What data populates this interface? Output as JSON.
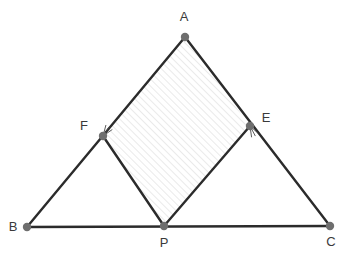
{
  "figure": {
    "canvas": {
      "width": 350,
      "height": 263,
      "background": "#ffffff"
    },
    "style": {
      "line_color": "#2b2b2b",
      "line_width": 2.4,
      "point_color": "#6e6e6e",
      "point_radius": 4.2,
      "label_color": "#3a3a3a",
      "label_font_size": 13,
      "hatch_color": "#d9d9d9",
      "hatch_angle_deg": 45,
      "hatch_spacing": 5,
      "tick_color": "#4a4a4a"
    },
    "points": [
      {
        "id": "A",
        "label": "A",
        "x": 185,
        "y": 37,
        "label_x": 184,
        "label_y": 18
      },
      {
        "id": "B",
        "label": "B",
        "x": 27,
        "y": 227,
        "label_x": 13,
        "label_y": 228
      },
      {
        "id": "C",
        "label": "C",
        "x": 330,
        "y": 226,
        "label_x": 331,
        "label_y": 243
      },
      {
        "id": "F",
        "label": "F",
        "x": 103,
        "y": 136,
        "label_x": 84,
        "label_y": 127
      },
      {
        "id": "E",
        "label": "E",
        "x": 250,
        "y": 126,
        "label_x": 266,
        "label_y": 119
      },
      {
        "id": "P",
        "label": "P",
        "x": 164,
        "y": 226,
        "label_x": 164,
        "label_y": 244
      }
    ],
    "segments": [
      {
        "id": "AB",
        "from": "A",
        "to": "B",
        "name": "segment-ab"
      },
      {
        "id": "AC",
        "from": "A",
        "to": "C",
        "name": "segment-ac"
      },
      {
        "id": "BC",
        "from": "B",
        "to": "C",
        "name": "segment-bc"
      },
      {
        "id": "FP",
        "from": "F",
        "to": "P",
        "name": "segment-fp"
      },
      {
        "id": "PE",
        "from": "P",
        "to": "E",
        "name": "segment-pe"
      }
    ],
    "shaded_region": {
      "name": "rhombus-afpe",
      "vertices": [
        "A",
        "F",
        "P",
        "E"
      ],
      "fill": "hatch"
    },
    "tick_marks": [
      {
        "id": "tick-f",
        "at": "F",
        "name": "congruence-tick-f",
        "angle_deg": -55,
        "count": 3,
        "length": 11,
        "spread_deg": 20
      },
      {
        "id": "tick-e",
        "at": "E",
        "name": "congruence-tick-e",
        "angle_deg": 62,
        "count": 3,
        "length": 11,
        "spread_deg": 20
      }
    ]
  }
}
